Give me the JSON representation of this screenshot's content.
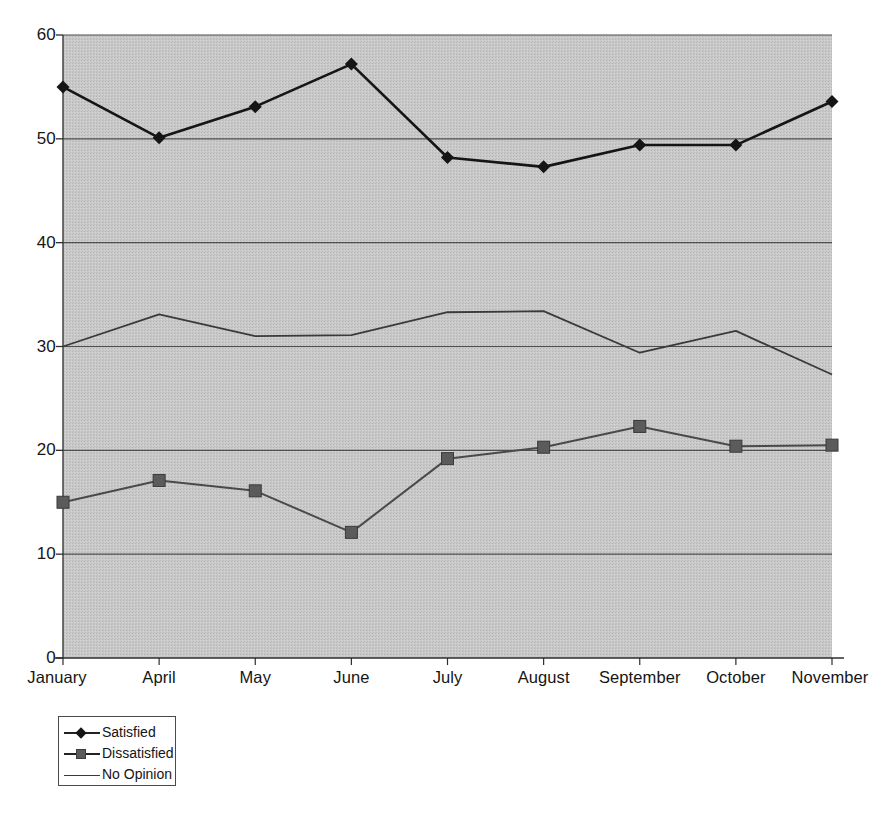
{
  "chart_data": {
    "type": "line",
    "title": "",
    "subtitle": "",
    "xlabel": "",
    "ylabel": "",
    "categories": [
      "January",
      "April",
      "May",
      "June",
      "July",
      "August",
      "September",
      "October",
      "November"
    ],
    "series": [
      {
        "name": "Satisfied",
        "marker": "diamond",
        "color": "#151515",
        "values": [
          55.0,
          50.1,
          53.1,
          57.2,
          48.2,
          47.3,
          49.4,
          49.4,
          53.6
        ]
      },
      {
        "name": "Dissatisfied",
        "marker": "square",
        "color": "#5b5b5b",
        "values": [
          15.0,
          17.1,
          16.1,
          12.1,
          19.2,
          20.3,
          22.3,
          20.4,
          20.5
        ]
      },
      {
        "name": "No Opinion",
        "marker": "none",
        "color": "#3a3a3a",
        "values": [
          30.0,
          33.1,
          31.0,
          31.1,
          33.3,
          33.4,
          29.4,
          31.5,
          27.3
        ]
      }
    ],
    "ylim": [
      0,
      60
    ],
    "yticks": [
      0,
      10,
      20,
      30,
      40,
      50,
      60
    ],
    "ytick_labels": [
      "0",
      "10",
      "20",
      "30",
      "40",
      "50",
      "60"
    ],
    "grid": true,
    "grid_axis": "y",
    "legend_position": "below-left",
    "plot_background": "#c9c9c9",
    "figure_background": "#ffffff"
  },
  "legend": {
    "items": [
      {
        "label": "Satisfied",
        "marker": "diamond-marker-icon"
      },
      {
        "label": "Dissatisfied",
        "marker": "square-marker-icon"
      },
      {
        "label": "No Opinion",
        "marker": "line-marker-icon"
      }
    ]
  }
}
